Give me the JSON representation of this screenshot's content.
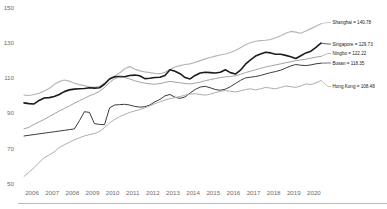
{
  "chart_data": {
    "type": "line",
    "title": "",
    "xlabel": "",
    "ylabel": "",
    "ylim": [
      50,
      150
    ],
    "yticks": [
      50,
      70,
      90,
      110,
      130,
      150
    ],
    "ytick_labels": [
      "50",
      "70",
      "90",
      "110",
      "130",
      "150"
    ],
    "xlim": [
      2005.5,
      2020.6
    ],
    "xticks": [
      2006,
      2007,
      2008,
      2009,
      2010,
      2011,
      2012,
      2013,
      2014,
      2015,
      2016,
      2017,
      2018,
      2019,
      2020
    ],
    "xtick_labels": [
      "2006",
      "2007",
      "2008",
      "2009",
      "2010",
      "2011",
      "2012",
      "2013",
      "2014",
      "2015",
      "2016",
      "2017",
      "2018",
      "2019",
      "2020"
    ],
    "grid": false,
    "legend_position": "right-inline-end-labels",
    "x": [
      2005.6,
      2005.85,
      2006.1,
      2006.35,
      2006.6,
      2006.85,
      2007.1,
      2007.35,
      2007.6,
      2007.85,
      2008.1,
      2008.35,
      2008.6,
      2008.85,
      2009.1,
      2009.35,
      2009.6,
      2009.85,
      2010.1,
      2010.35,
      2010.6,
      2010.85,
      2011.1,
      2011.35,
      2011.6,
      2011.85,
      2012.1,
      2012.35,
      2012.6,
      2012.85,
      2013.1,
      2013.35,
      2013.6,
      2013.85,
      2014.1,
      2014.35,
      2014.6,
      2014.85,
      2015.1,
      2015.35,
      2015.6,
      2015.85,
      2016.1,
      2016.35,
      2016.6,
      2016.85,
      2017.1,
      2017.35,
      2017.6,
      2017.85,
      2018.1,
      2018.35,
      2018.6,
      2018.85,
      2019.1,
      2019.35,
      2019.6,
      2019.85,
      2020.1,
      2020.35
    ],
    "series": [
      {
        "name": "Shanghai",
        "end_value": 140.78,
        "end_label": "Shanghai = 140.78",
        "color": "#b5b5b5",
        "width": 1.15,
        "values": [
          100.2,
          100.0,
          100.6,
          101.3,
          102.5,
          104.0,
          106.2,
          107.9,
          108.8,
          108.2,
          107.0,
          106.2,
          105.6,
          105.0,
          104.6,
          105.2,
          107.2,
          109.6,
          111.0,
          112.8,
          115.2,
          116.4,
          115.0,
          114.0,
          113.4,
          113.0,
          112.6,
          112.4,
          113.2,
          114.8,
          116.2,
          117.0,
          117.6,
          118.0,
          118.8,
          119.8,
          120.8,
          121.6,
          122.4,
          123.0,
          123.6,
          124.4,
          125.6,
          127.2,
          128.8,
          130.0,
          130.8,
          131.2,
          131.4,
          131.8,
          132.8,
          134.0,
          135.4,
          136.4,
          136.0,
          135.4,
          136.6,
          138.0,
          139.4,
          140.78
        ]
      },
      {
        "name": "Singapore",
        "end_value": 129.73,
        "end_label": "Singapore = 129.73",
        "color": "#1c1c1c",
        "width": 1.6,
        "values": [
          95.8,
          95.4,
          95.2,
          97.2,
          98.6,
          98.8,
          99.4,
          100.6,
          102.2,
          103.2,
          103.6,
          103.8,
          104.0,
          104.4,
          104.2,
          104.4,
          106.4,
          109.4,
          110.6,
          110.8,
          110.6,
          111.4,
          111.6,
          111.2,
          109.6,
          109.8,
          110.2,
          110.4,
          111.4,
          114.6,
          113.8,
          112.4,
          110.2,
          109.4,
          111.4,
          112.8,
          113.2,
          113.0,
          112.8,
          113.2,
          114.6,
          113.0,
          112.2,
          114.4,
          117.8,
          120.2,
          122.4,
          123.6,
          124.6,
          124.2,
          123.4,
          123.4,
          122.8,
          122.0,
          121.0,
          122.6,
          124.2,
          125.2,
          127.4,
          129.73
        ]
      },
      {
        "name": "Ningbo",
        "end_value": 122.22,
        "end_label": "Ningbo = 122.22",
        "color": "#9d9d9d",
        "width": 0.95,
        "values": [
          81.0,
          82.0,
          83.6,
          85.0,
          86.4,
          88.0,
          89.6,
          91.2,
          92.6,
          94.0,
          95.6,
          97.0,
          98.4,
          99.8,
          101.0,
          102.4,
          104.6,
          107.4,
          109.6,
          110.4,
          110.2,
          109.4,
          108.4,
          107.6,
          107.0,
          106.6,
          106.4,
          106.8,
          107.4,
          108.0,
          107.6,
          107.2,
          106.8,
          106.6,
          107.0,
          107.6,
          108.4,
          109.0,
          109.6,
          110.2,
          110.6,
          110.8,
          111.2,
          112.0,
          113.0,
          113.8,
          114.6,
          115.4,
          116.2,
          116.8,
          117.4,
          118.0,
          118.6,
          119.2,
          119.8,
          120.2,
          120.6,
          121.2,
          121.8,
          122.22
        ]
      },
      {
        "name": "Busan",
        "end_value": 118.35,
        "end_label": "Busan = 118.35",
        "color": "#3c3c3c",
        "width": 1.0,
        "values": [
          77.0,
          77.4,
          77.8,
          78.2,
          78.6,
          79.0,
          79.4,
          79.8,
          80.2,
          80.6,
          81.0,
          85.6,
          90.8,
          90.4,
          84.0,
          83.6,
          83.4,
          93.0,
          94.6,
          94.8,
          95.0,
          94.6,
          93.8,
          93.4,
          93.6,
          94.6,
          96.4,
          97.8,
          99.8,
          100.6,
          99.0,
          98.4,
          99.2,
          101.4,
          103.4,
          104.8,
          105.2,
          104.4,
          103.4,
          103.0,
          103.6,
          105.0,
          106.8,
          108.6,
          110.0,
          110.4,
          110.8,
          111.4,
          112.2,
          113.0,
          113.6,
          114.4,
          115.6,
          116.8,
          117.6,
          117.2,
          117.0,
          117.4,
          118.0,
          118.35
        ]
      },
      {
        "name": "Hong Kong",
        "end_value": 108.48,
        "end_label": "Hong Kong = 108.48",
        "color": "#a9a9a9",
        "width": 0.95,
        "values": [
          54.0,
          56.4,
          59.0,
          62.0,
          64.6,
          66.2,
          68.0,
          70.4,
          72.0,
          73.4,
          74.8,
          76.0,
          77.0,
          77.8,
          78.4,
          79.6,
          81.8,
          84.4,
          86.4,
          88.0,
          89.2,
          90.4,
          91.2,
          92.0,
          93.0,
          94.2,
          95.4,
          96.4,
          97.4,
          98.2,
          98.8,
          99.4,
          100.2,
          100.8,
          101.0,
          100.6,
          100.2,
          100.8,
          101.6,
          102.4,
          102.8,
          102.4,
          102.0,
          102.6,
          103.4,
          103.8,
          103.2,
          103.8,
          104.6,
          104.2,
          103.8,
          104.6,
          105.4,
          105.0,
          104.6,
          105.4,
          106.6,
          106.2,
          107.2,
          108.48
        ]
      }
    ]
  }
}
